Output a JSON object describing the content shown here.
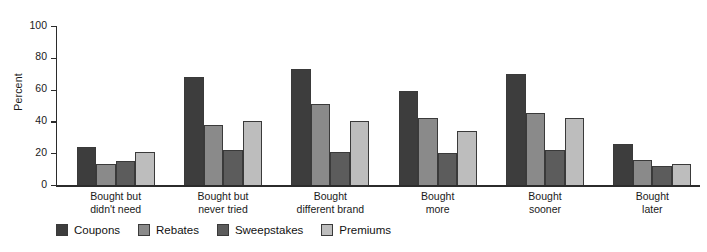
{
  "chart_data": {
    "type": "bar",
    "title": "",
    "subtitle": "",
    "xlabel": "",
    "ylabel": "Percent",
    "ylim": [
      0,
      100
    ],
    "yticks": [
      0,
      20,
      40,
      60,
      80,
      100
    ],
    "grid": false,
    "legend_position": "bottom",
    "categories": [
      "Bought but\ndidn't need",
      "Bought but\nnever tried",
      "Bought\ndifferent brand",
      "Bought\nmore",
      "Bought\nsooner",
      "Bought\nlater"
    ],
    "categories_lines": [
      [
        "Bought but",
        "didn't need"
      ],
      [
        "Bought but",
        "never tried"
      ],
      [
        "Bought",
        "different brand"
      ],
      [
        "Bought",
        "more"
      ],
      [
        "Bought",
        "sooner"
      ],
      [
        "Bought",
        "later"
      ]
    ],
    "series": [
      {
        "name": "Coupons",
        "color": "#3d3d3d",
        "values": [
          24,
          68,
          73,
          59,
          70,
          26
        ]
      },
      {
        "name": "Rebates",
        "color": "#8a8a8a",
        "values": [
          13,
          38,
          51,
          42,
          45,
          16
        ]
      },
      {
        "name": "Sweepstakes",
        "color": "#5c5c5c",
        "values": [
          15,
          22,
          21,
          20,
          22,
          12
        ]
      },
      {
        "name": "Premiums",
        "color": "#bdbdbd",
        "values": [
          21,
          40,
          40,
          34,
          42,
          13
        ]
      }
    ]
  },
  "axis": {
    "y_title": "Percent",
    "tick_labels": [
      "100",
      "80",
      "60",
      "40",
      "20",
      "0"
    ]
  },
  "legend": {
    "items": [
      {
        "label": "Coupons",
        "swatch": "legend-swatch-coupons"
      },
      {
        "label": "Rebates",
        "swatch": "legend-swatch-rebates"
      },
      {
        "label": "Sweepstakes",
        "swatch": "legend-swatch-sweepstakes"
      },
      {
        "label": "Premiums",
        "swatch": "legend-swatch-premiums"
      }
    ]
  }
}
